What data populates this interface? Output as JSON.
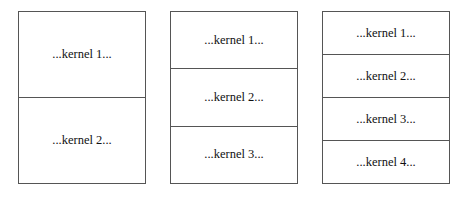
{
  "diagram": {
    "partitions": [
      {
        "name": "two-kernel",
        "cells": [
          "...kernel 1...",
          "...kernel 2..."
        ]
      },
      {
        "name": "three-kernel",
        "cells": [
          "...kernel 1...",
          "...kernel 2...",
          "...kernel 3..."
        ]
      },
      {
        "name": "four-kernel",
        "cells": [
          "...kernel 1...",
          "...kernel 2...",
          "...kernel 3...",
          "...kernel 4..."
        ]
      }
    ]
  }
}
